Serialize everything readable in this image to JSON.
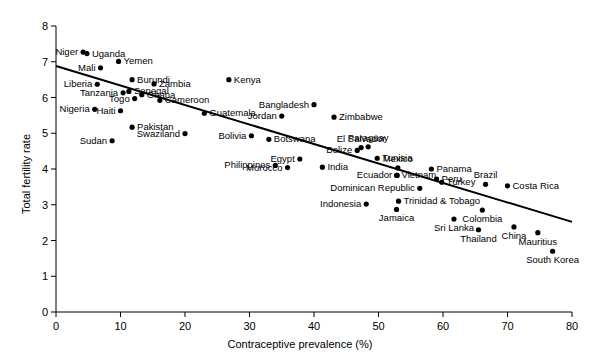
{
  "chart_data": {
    "type": "scatter",
    "title": "",
    "xlabel": "Contraceptive prevalence (%)",
    "ylabel": "Total fertility rate",
    "xlim": [
      0,
      80
    ],
    "ylim": [
      0,
      8
    ],
    "xticks": [
      0,
      10,
      20,
      30,
      40,
      50,
      60,
      70,
      80
    ],
    "yticks": [
      0,
      1,
      2,
      3,
      4,
      5,
      6,
      7,
      8
    ],
    "grid": false,
    "legend": null,
    "trendline": {
      "type": "linear-regression",
      "x_start": 0,
      "y_start": 6.88,
      "x_end": 80,
      "y_end": 2.52
    },
    "points": [
      {
        "name": "Niger",
        "x": 4.2,
        "y": 7.27,
        "label_pos": "left"
      },
      {
        "name": "Uganda",
        "x": 4.8,
        "y": 7.23,
        "label_pos": "right"
      },
      {
        "name": "Mali",
        "x": 6.9,
        "y": 6.83,
        "label_pos": "left"
      },
      {
        "name": "Yemen",
        "x": 9.7,
        "y": 7.01,
        "label_pos": "right"
      },
      {
        "name": "Burundi",
        "x": 11.8,
        "y": 6.5,
        "label_pos": "right"
      },
      {
        "name": "Liberia",
        "x": 6.4,
        "y": 6.37,
        "label_pos": "left"
      },
      {
        "name": "Senegal",
        "x": 11.3,
        "y": 6.17,
        "label_pos": "right"
      },
      {
        "name": "Tanzania",
        "x": 10.4,
        "y": 6.13,
        "label_pos": "left"
      },
      {
        "name": "Zambia",
        "x": 15.2,
        "y": 6.38,
        "label_pos": "right"
      },
      {
        "name": "Nigeria",
        "x": 6.0,
        "y": 5.67,
        "label_pos": "left"
      },
      {
        "name": "Haiti",
        "x": 10.0,
        "y": 5.63,
        "label_pos": "left"
      },
      {
        "name": "Togo",
        "x": 12.2,
        "y": 5.97,
        "label_pos": "left"
      },
      {
        "name": "Ghana",
        "x": 13.3,
        "y": 6.08,
        "label_pos": "right"
      },
      {
        "name": "Cameroon",
        "x": 16.1,
        "y": 5.92,
        "label_pos": "right"
      },
      {
        "name": "Kenya",
        "x": 26.8,
        "y": 6.5,
        "label_pos": "right"
      },
      {
        "name": "Guatemala",
        "x": 23.0,
        "y": 5.56,
        "label_pos": "right"
      },
      {
        "name": "Pakistan",
        "x": 11.8,
        "y": 5.17,
        "label_pos": "right"
      },
      {
        "name": "Sudan",
        "x": 8.7,
        "y": 4.79,
        "label_pos": "left"
      },
      {
        "name": "Swaziland",
        "x": 20.0,
        "y": 4.99,
        "label_pos": "left"
      },
      {
        "name": "Bangladesh",
        "x": 40.0,
        "y": 5.8,
        "label_pos": "left"
      },
      {
        "name": "Zimbabwe",
        "x": 43.1,
        "y": 5.45,
        "label_pos": "right"
      },
      {
        "name": "Jordan",
        "x": 35.0,
        "y": 5.48,
        "label_pos": "left"
      },
      {
        "name": "Botswana",
        "x": 33.0,
        "y": 4.83,
        "label_pos": "right"
      },
      {
        "name": "Bolivia",
        "x": 30.3,
        "y": 4.93,
        "label_pos": "left"
      },
      {
        "name": "Egypt",
        "x": 37.8,
        "y": 4.28,
        "label_pos": "left"
      },
      {
        "name": "Philippines",
        "x": 34.0,
        "y": 4.1,
        "label_pos": "left"
      },
      {
        "name": "Morocco",
        "x": 35.9,
        "y": 4.04,
        "label_pos": "left"
      },
      {
        "name": "India",
        "x": 41.3,
        "y": 4.05,
        "label_pos": "right"
      },
      {
        "name": "El Salvador",
        "x": 47.3,
        "y": 4.6,
        "label_pos": "above"
      },
      {
        "name": "Belize",
        "x": 46.7,
        "y": 4.52,
        "label_pos": "left"
      },
      {
        "name": "Paraguay",
        "x": 48.4,
        "y": 4.62,
        "label_pos": "above"
      },
      {
        "name": "Tunisia",
        "x": 49.8,
        "y": 4.3,
        "label_pos": "right"
      },
      {
        "name": "Mexico",
        "x": 53.0,
        "y": 4.03,
        "label_pos": "above"
      },
      {
        "name": "Panama",
        "x": 58.2,
        "y": 4.0,
        "label_pos": "right"
      },
      {
        "name": "Vietnam",
        "x": 52.8,
        "y": 3.82,
        "label_pos": "right"
      },
      {
        "name": "Ecuador",
        "x": 52.9,
        "y": 3.82,
        "label_pos": "left"
      },
      {
        "name": "Peru",
        "x": 59.0,
        "y": 3.72,
        "label_pos": "right"
      },
      {
        "name": "Brazil",
        "x": 66.6,
        "y": 3.57,
        "label_pos": "above"
      },
      {
        "name": "Costa Rica",
        "x": 70.0,
        "y": 3.53,
        "label_pos": "right"
      },
      {
        "name": "Turkey",
        "x": 59.8,
        "y": 3.63,
        "label_pos": "right"
      },
      {
        "name": "Dominican Republic",
        "x": 56.4,
        "y": 3.46,
        "label_pos": "left"
      },
      {
        "name": "Trinidad & Tobago",
        "x": 53.1,
        "y": 3.1,
        "label_pos": "right"
      },
      {
        "name": "Indonesia",
        "x": 48.1,
        "y": 3.02,
        "label_pos": "left"
      },
      {
        "name": "Jamaica",
        "x": 52.8,
        "y": 2.87,
        "label_pos": "below"
      },
      {
        "name": "Sri Lanka",
        "x": 61.7,
        "y": 2.6,
        "label_pos": "below"
      },
      {
        "name": "Colombia",
        "x": 66.1,
        "y": 2.85,
        "label_pos": "below"
      },
      {
        "name": "Thailand",
        "x": 65.5,
        "y": 2.3,
        "label_pos": "below"
      },
      {
        "name": "China",
        "x": 71.0,
        "y": 2.38,
        "label_pos": "below"
      },
      {
        "name": "Mauritius",
        "x": 74.7,
        "y": 2.22,
        "label_pos": "below"
      },
      {
        "name": "South Korea",
        "x": 77.0,
        "y": 1.7,
        "label_pos": "below"
      }
    ]
  }
}
